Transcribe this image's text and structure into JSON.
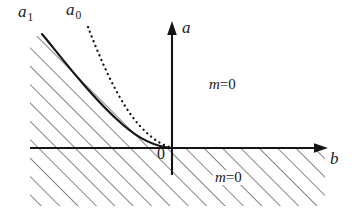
{
  "figure": {
    "axes": {
      "horizontal": {
        "label": "b",
        "label_style": "italic",
        "arrow": "right"
      },
      "vertical": {
        "label": "a",
        "label_style": "italic",
        "arrow": "up"
      },
      "origin_label": "0"
    },
    "curves": [
      {
        "name": "a1",
        "base": "a",
        "subscript": "1",
        "style": "solid",
        "shape": "convex-decreasing"
      },
      {
        "name": "a0",
        "base": "a",
        "subscript": "0",
        "style": "dotted",
        "shape": "convex-decreasing"
      }
    ],
    "region_labels": [
      {
        "id": "m-upper",
        "base": "m",
        "relation": "=0",
        "text": "m=0",
        "position": "upper-right-quadrant"
      },
      {
        "id": "m-lower",
        "base": "m",
        "relation": "=0",
        "text": "m=0",
        "position": "below-horizontal-axis"
      }
    ],
    "hatching": {
      "angle_deg": 45,
      "spacing_px": 9,
      "color": "#2b2b2b",
      "regions": [
        "left-of-solid-curve-above-axis",
        "below-horizontal-axis"
      ]
    },
    "colors": {
      "ink": "#1a1a1a",
      "hatch": "#2b2b2b",
      "background": "#ffffff"
    }
  }
}
